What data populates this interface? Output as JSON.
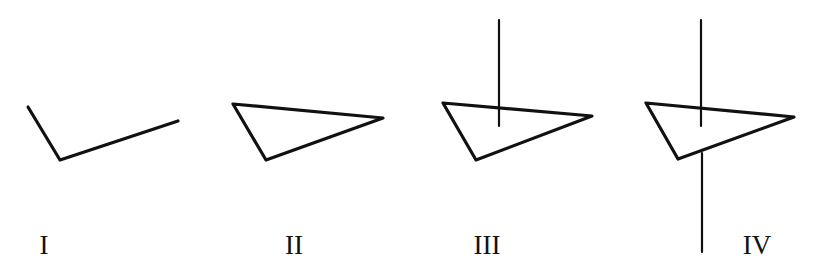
{
  "figures": [
    {
      "id": "I",
      "label": "I",
      "label_pos": [
        44,
        254
      ],
      "shape": "open-angle",
      "points": [
        [
          28,
          107
        ],
        [
          60,
          160
        ],
        [
          178,
          121
        ]
      ]
    },
    {
      "id": "II",
      "label": "II",
      "label_pos": [
        294,
        254
      ],
      "shape": "triangle",
      "points": [
        [
          233,
          104
        ],
        [
          383,
          118
        ],
        [
          266,
          160
        ]
      ]
    },
    {
      "id": "III",
      "label": "III",
      "label_pos": [
        487,
        254
      ],
      "shape": "triangle-with-vertical-line-above",
      "points": [
        [
          443,
          103
        ],
        [
          592,
          116
        ],
        [
          476,
          160
        ]
      ],
      "line": {
        "x": 499,
        "y1": 20,
        "y2": 126
      }
    },
    {
      "id": "IV",
      "label": "IV",
      "label_pos": [
        757,
        254
      ],
      "shape": "triangle-pierced-by-vertical-line",
      "points": [
        [
          646,
          103
        ],
        [
          794,
          117
        ],
        [
          678,
          159
        ]
      ],
      "line_top": {
        "x": 701,
        "y1": 20,
        "y2": 126
      },
      "line_bottom": {
        "x": 702,
        "y1": 153,
        "y2": 252
      }
    }
  ],
  "colors": {
    "stroke": "#111111",
    "background": "#ffffff"
  }
}
